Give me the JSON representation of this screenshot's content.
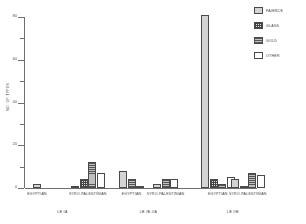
{
  "chart_data": {
    "type": "bar",
    "title": "",
    "subtitle": "",
    "xlabel": "",
    "ylabel": "NO. OF TYPES",
    "ylim": [
      0,
      80
    ],
    "yticks": [
      0,
      10,
      20,
      30,
      40,
      50,
      60,
      70,
      80
    ],
    "ytick_labels_major": [
      "0",
      "20",
      "40",
      "60",
      "80"
    ],
    "grid": false,
    "legend_position": "top-right",
    "categories": [
      "EGYPTIAN",
      "SYRO-PALESTINIAN",
      "EGYPTIAN",
      "SYRO-PALESTINIAN",
      "EGYPTIAN",
      "SYRO-PALESTINIAN"
    ],
    "group_labels": [
      "LB IA",
      "LB IB-IIA",
      "LB IIB"
    ],
    "series": [
      {
        "name": "FAIENCE",
        "values": [
          2,
          1,
          8,
          2,
          81,
          4
        ]
      },
      {
        "name": "GLASS",
        "values": [
          0,
          4,
          0,
          0,
          4,
          1
        ]
      },
      {
        "name": "GOLD",
        "values": [
          0,
          12,
          4,
          4,
          2,
          7
        ]
      },
      {
        "name": "OTHER",
        "values": [
          0,
          7,
          1,
          4,
          5,
          6
        ]
      }
    ]
  },
  "legend": {
    "items": [
      {
        "label": "FAIENCE",
        "pattern": "solid-gray"
      },
      {
        "label": "GLASS",
        "pattern": "cross-hatch-dots"
      },
      {
        "label": "GOLD",
        "pattern": "horizontal-lines"
      },
      {
        "label": "OTHER",
        "pattern": "empty-white"
      }
    ]
  },
  "axis": {
    "y_title": "NO. OF TYPES",
    "y_labels": [
      "80",
      "60",
      "40",
      "20",
      "0"
    ]
  },
  "x_axis": {
    "tick_labels": [
      "EGYPTIAN",
      "SYRO-PALESTINIAN",
      "EGYPTIAN",
      "SYRO-PALESTINIAN",
      "EGYPTIAN",
      "SYRO-PALESTINIAN"
    ],
    "group_labels": [
      "LB IA",
      "LB IB-IIA",
      "LB IIB"
    ]
  }
}
